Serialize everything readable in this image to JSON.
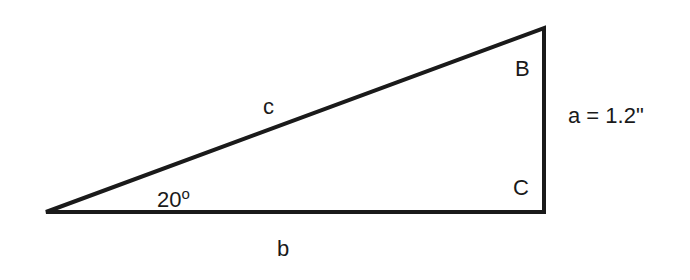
{
  "diagram": {
    "type": "right-triangle",
    "line_color": "#1a1a1a",
    "vertices": {
      "A": {
        "x": 46,
        "y": 212
      },
      "B": {
        "x": 544,
        "y": 28
      },
      "C": {
        "x": 544,
        "y": 212
      }
    },
    "labels": {
      "hypotenuse": "c",
      "base": "b",
      "side_a": "a = 1.2\"",
      "angle_value": "20",
      "angle_unit": "o",
      "vertex_B": "B",
      "vertex_C": "C"
    }
  }
}
